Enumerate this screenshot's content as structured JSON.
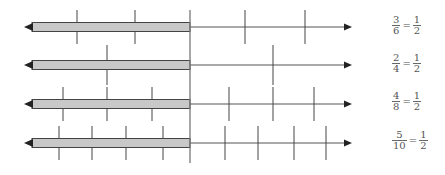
{
  "diagram": {
    "title": "",
    "colors": {
      "bar_fill": "#c8c8c8",
      "bar_stroke": "#444444",
      "line": "#555555",
      "tick": "#444444",
      "text": "#555555"
    },
    "divider_x": 190,
    "rows": [
      {
        "y": 27,
        "left_ticks": [
          77,
          135
        ],
        "right_ticks": [
          245,
          305
        ],
        "equation": {
          "lhs_num": "3",
          "lhs_den": "6",
          "eq": "=",
          "rhs_num": "1",
          "rhs_den": "2"
        }
      },
      {
        "y": 65,
        "left_ticks": [
          107
        ],
        "right_ticks": [
          273
        ],
        "equation": {
          "lhs_num": "2",
          "lhs_den": "4",
          "eq": "=",
          "rhs_num": "1",
          "rhs_den": "2"
        }
      },
      {
        "y": 104,
        "left_ticks": [
          63,
          107,
          152
        ],
        "right_ticks": [
          229,
          273,
          314
        ],
        "equation": {
          "lhs_num": "4",
          "lhs_den": "8",
          "eq": "=",
          "rhs_num": "1",
          "rhs_den": "2"
        }
      },
      {
        "y": 143,
        "left_ticks": [
          59,
          92,
          126,
          163
        ],
        "right_ticks": [
          225,
          258,
          294,
          326
        ],
        "equation": {
          "lhs_num": "5",
          "lhs_den": "10",
          "eq": "=",
          "rhs_num": "1",
          "rhs_den": "2"
        }
      }
    ]
  }
}
